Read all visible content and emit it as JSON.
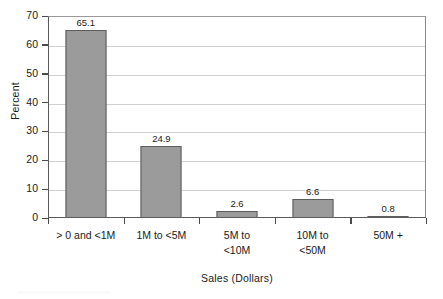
{
  "chart_data": {
    "type": "bar",
    "title": "",
    "subtitle": "",
    "xlabel": "Sales (Dollars)",
    "ylabel": "Percent",
    "categories": [
      "> 0 and <1M",
      "1M to <5M",
      "5M to\n<10M",
      "10M to\n<50M",
      "50M +"
    ],
    "values": [
      65.1,
      24.9,
      2.6,
      6.6,
      0.8
    ],
    "value_labels": [
      "65.1",
      "24.9",
      "2.6",
      "6.6",
      "0.8"
    ],
    "ylim": [
      0,
      70
    ],
    "ytick_values": [
      0,
      10,
      20,
      30,
      40,
      50,
      60,
      70
    ],
    "ytick_labels": [
      "0",
      "10",
      "20",
      "30",
      "40",
      "50",
      "60",
      "70"
    ],
    "grid": "horizontal",
    "legend": "none",
    "colors": {
      "bar_fill": "#9b9b9b",
      "bar_border": "#5c5c5c",
      "gridline": "#d0d0d0",
      "axis": "#4a4a4a",
      "text": "#1a1a1a",
      "background": "#ffffff"
    }
  }
}
